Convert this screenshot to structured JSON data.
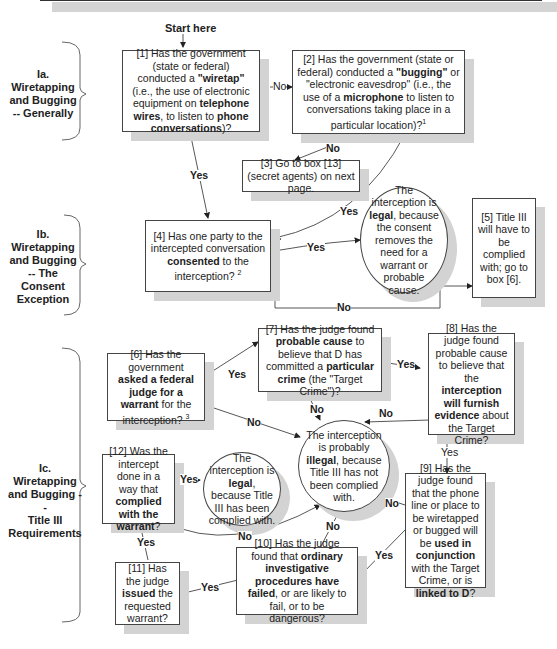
{
  "start_label": "Start here",
  "sections": [
    {
      "id": "Ia",
      "label_line1": "Ia.",
      "label_line2": "Wiretapping",
      "label_line3": "and Bugging",
      "label_line4": "-- Generally"
    },
    {
      "id": "Ib",
      "label_line1": "Ib.",
      "label_line2": "Wiretapping",
      "label_line3": "and Bugging",
      "label_line4": "-- The",
      "label_line5": "Consent",
      "label_line6": "Exception"
    },
    {
      "id": "Ic",
      "label_line1": "Ic.",
      "label_line2": "Wiretapping",
      "label_line3": "and Bugging --",
      "label_line4": "Title III",
      "label_line5": "Requirements"
    }
  ],
  "boxes": {
    "b1": {
      "pre": "[1] Has the government (state or federal) conducted a ",
      "bold1": "\"wiretap\"",
      "mid1": " (i.e., the use of electronic equipment on ",
      "bold2": "telephone wires",
      "mid2": ", to listen to ",
      "bold3": "phone conversations",
      "post": ")?"
    },
    "b2": {
      "pre": "[2] Has the government (state or federal) conducted a ",
      "bold1": "\"bugging\"",
      "mid1": " or \"electronic eavesdrop\" (i.e., the use of a ",
      "bold2": "microphone",
      "post": " to listen to conversations taking place in a particular location)?",
      "footnote": "1"
    },
    "b3": {
      "text": "[3] Go to box [13] (secret agents) on next page."
    },
    "b4": {
      "pre": "[4] Has one party to the intercepted conversation ",
      "bold1": "consented",
      "post": " to the interception?",
      "footnote": "2"
    },
    "legal_consent": {
      "pre": "The interception is ",
      "bold1": "legal",
      "post": ", because the consent removes the need for a warrant or probable cause."
    },
    "b5": {
      "text": "[5] Title III will have to be complied with; go to box [6]."
    },
    "b6": {
      "pre": "[6] Has the government ",
      "bold1": "asked a federal judge for a warrant",
      "post": " for the interception?",
      "footnote": "3"
    },
    "b7": {
      "pre": "[7] Has the judge found ",
      "bold1": "probable cause",
      "mid1": " to believe that D has committed a ",
      "bold2": "particular crime",
      "post": " (the \"Target Crime\")?"
    },
    "b8": {
      "pre": "[8] Has the judge found probable cause to believe that the ",
      "bold1": "interception will furnish evidence",
      "post": " about the Target Crime?"
    },
    "illegal": {
      "pre": "The interception is probably ",
      "bold1": "illegal",
      "post": ", because Title III has not been complied with."
    },
    "b9": {
      "pre": "[9] Has the judge found that the phone line or place to be wiretapped or bugged will be ",
      "bold1": "used in conjunction",
      "mid1": " with the Target Crime, or is ",
      "bold2": "linked to D",
      "post": "?"
    },
    "b10": {
      "pre": "[10] Has the judge found that ",
      "bold1": "ordinary investigative procedures have failed",
      "post": ", or are likely to fail, or to be dangerous?"
    },
    "b11": {
      "pre": "[11] Has the judge ",
      "bold1": "issued",
      "post": " the requested warrant?"
    },
    "b12": {
      "pre": "[12] Was the intercept done in a way that ",
      "bold1": "complied with the warrant",
      "post": "?"
    },
    "legal_title3": {
      "pre": "The interception is ",
      "bold1": "legal",
      "post": ", because Title III has been complied with."
    }
  },
  "edge_labels": {
    "b1_b2": "No",
    "b1_b4": "Yes",
    "b2_b3": "No",
    "b2_b4": "Yes",
    "b4_legal": "Yes",
    "b4_b5": "No",
    "b6_b7": "Yes",
    "b6_illegal": "No",
    "b7_b8": "Yes",
    "b7_illegal": "No",
    "b8_illegal": "No",
    "b8_b9": "Yes",
    "b9_illegal": "No",
    "b9_b10": "Yes",
    "b10_illegal": "No",
    "b10_b11": "Yes",
    "b11_b12": "Yes",
    "b12_legal": "Yes",
    "b12_illegal": "No"
  }
}
